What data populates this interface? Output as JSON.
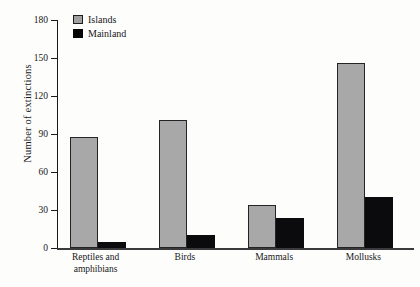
{
  "chart_data": {
    "type": "bar",
    "title": "",
    "xlabel": "",
    "ylabel": "Number of extinctions",
    "categories": [
      "Reptiles and\namphibians",
      "Birds",
      "Mammals",
      "Mollusks"
    ],
    "series": [
      {
        "name": "Islands",
        "color": "#a8a8a8",
        "values": [
          88,
          101,
          34,
          146
        ]
      },
      {
        "name": "Mainland",
        "color": "#0b0b0d",
        "values": [
          5,
          10,
          24,
          40
        ]
      }
    ],
    "yticks": [
      0,
      30,
      60,
      90,
      120,
      150,
      180
    ],
    "ytick_labels": [
      "0",
      "30",
      "60",
      "90",
      "120",
      "150",
      "180"
    ],
    "ylim": [
      0,
      180
    ],
    "grid": false,
    "legend_position": "top-left-inside"
  },
  "legend": {
    "items": [
      {
        "label": "Islands",
        "swatch": "gray-swatch-icon"
      },
      {
        "label": "Mainland",
        "swatch": "black-swatch-icon"
      }
    ]
  }
}
